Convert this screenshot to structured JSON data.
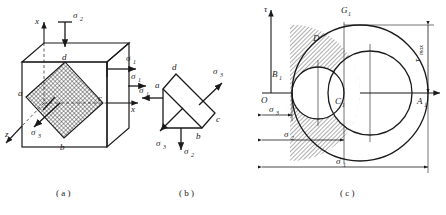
{
  "figure": {
    "type": "three-dimensional-stress-state-and-mohr-circles",
    "captions": {
      "a": "( a )",
      "b": "( b )",
      "c": "( c )"
    }
  },
  "panel_a": {
    "name": "stressed-cube-element",
    "axes": {
      "x_vertical": "x",
      "x_horizontal": "x",
      "z": "z"
    },
    "stress_labels": {
      "sigma2_top": "σ",
      "sigma2_top_sub": "2",
      "sigma1_face": "σ",
      "sigma1_face_sub": "1",
      "sigma1_axis": "σ",
      "sigma1_axis_sub": "1",
      "sigma3": "σ",
      "sigma3_sub": "3"
    },
    "plane_vertices": [
      "a",
      "b",
      "c",
      "d"
    ]
  },
  "panel_b": {
    "name": "isolated-wedge-element",
    "vertices": [
      "a",
      "b",
      "c",
      "d"
    ],
    "stress_labels": {
      "sigma1": "σ",
      "sigma1_sub": "1",
      "sigma2": "σ",
      "sigma2_sub": "2",
      "sigma3_upper": "σ",
      "sigma3_upper_sub": "3",
      "sigma3_lower": "σ",
      "sigma3_lower_sub": "3"
    }
  },
  "panel_c": {
    "name": "mohr-circle-diagram",
    "axis_labels": {
      "tau": "τ",
      "origin": "O"
    },
    "points": {
      "A1": "A",
      "A1_sub": "1",
      "B1": "B",
      "B1_sub": "1",
      "C1": "C",
      "C1_sub": "1",
      "G1": "G",
      "G1_sub": "1",
      "D": "D"
    },
    "dimensions": {
      "tau_max": "τ",
      "tau_max_sub": "max",
      "sigma1": "σ",
      "sigma1_sub": "1",
      "sigma2": "σ",
      "sigma2_sub": "2",
      "sigma3": "σ",
      "sigma3_sub": "3"
    },
    "circles": {
      "large_sigma1_sigma3": "outer circle through B1 and A1",
      "small_left_sigma2_sigma3": "left small circle",
      "small_right_sigma1_sigma2": "right small circle",
      "shaded_region": "D"
    }
  }
}
